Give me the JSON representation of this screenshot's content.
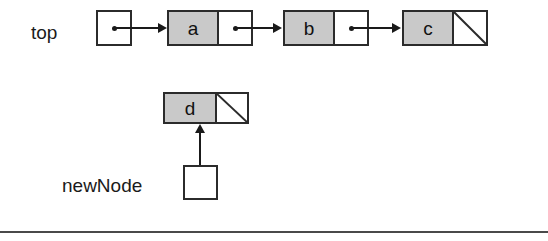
{
  "diagram": {
    "background_color": "#ffffff",
    "node_fill_color": "#c9c9c9",
    "stroke_color": "#2b2b2b",
    "arrow_color": "#1a1a1a"
  },
  "labels": {
    "top": "top",
    "new_node": "newNode"
  },
  "list": {
    "head_pointer_name": "top",
    "nodes": [
      {
        "value": "a",
        "next": "b"
      },
      {
        "value": "b",
        "next": "c"
      },
      {
        "value": "c",
        "next": "null"
      }
    ]
  },
  "detached": {
    "pointer_name": "newNode",
    "node": {
      "value": "d",
      "next": "null"
    }
  },
  "footer": {
    "rule": ""
  }
}
